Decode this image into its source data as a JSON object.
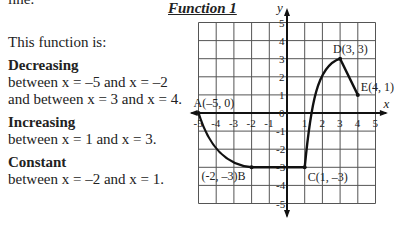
{
  "text": {
    "top_fragment": "line.",
    "intro": "This function is:",
    "sections": [
      {
        "heading": "Decreasing",
        "lines": [
          "between x = –5 and x = –2",
          "and between x = 3 and x = 4."
        ]
      },
      {
        "heading": "Increasing",
        "lines": [
          "between x = 1 and x = 3."
        ]
      },
      {
        "heading": "Constant",
        "lines": [
          "between x = –2 and x = 1."
        ]
      }
    ]
  },
  "chart_data": {
    "type": "line",
    "title": "Function 1",
    "xlabel": "x",
    "ylabel": "y",
    "xlim": [
      -5,
      5
    ],
    "ylim": [
      -5,
      5
    ],
    "grid": true,
    "x_ticks": [
      "-5",
      "-4",
      "-3",
      "-2",
      "-1",
      "1",
      "2",
      "3",
      "4",
      "5"
    ],
    "y_ticks": [
      "5",
      "4",
      "3",
      "2",
      "1",
      "0",
      "-1",
      "-2",
      "-3",
      "-4",
      "-5"
    ],
    "points": [
      {
        "label": "A(–5, 0)",
        "x": -5,
        "y": 0
      },
      {
        "label": "(-2, –3)B",
        "x": -2,
        "y": -3
      },
      {
        "label": "C(1, –3)",
        "x": 1,
        "y": -3
      },
      {
        "label": "D(3, 3)",
        "x": 3,
        "y": 3
      },
      {
        "label": "E(4, 1)",
        "x": 4,
        "y": 1
      }
    ],
    "segments": [
      {
        "from": "A",
        "to": "B",
        "shape": "curve",
        "trend": "decreasing"
      },
      {
        "from": "B",
        "to": "C",
        "shape": "line",
        "trend": "constant"
      },
      {
        "from": "C",
        "to": "D",
        "shape": "curve",
        "trend": "increasing"
      },
      {
        "from": "D",
        "to": "E",
        "shape": "line",
        "trend": "decreasing"
      }
    ]
  }
}
